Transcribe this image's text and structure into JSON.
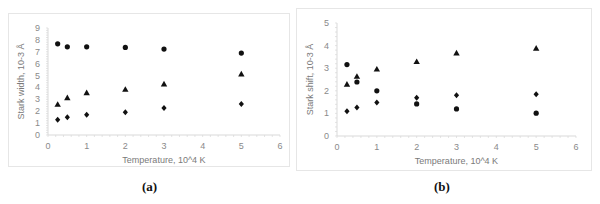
{
  "chart_data": [
    {
      "type": "scatter",
      "caption": "(a)",
      "title": "",
      "xlabel": "Temperature, 10^4 K",
      "ylabel": "Stark width, 10-3 Å",
      "xlim": [
        0,
        6
      ],
      "ylim": [
        0,
        9
      ],
      "xticks": [
        0,
        1,
        2,
        3,
        4,
        5,
        6
      ],
      "yticks": [
        0,
        1,
        2,
        3,
        4,
        5,
        6,
        7,
        8,
        9
      ],
      "grid": false,
      "legend": "none",
      "series": [
        {
          "name": "series-circle",
          "marker": "circle",
          "x": [
            0.25,
            0.5,
            1,
            2,
            3,
            5
          ],
          "y": [
            7.67,
            7.42,
            7.42,
            7.37,
            7.23,
            6.89
          ]
        },
        {
          "name": "series-triangle",
          "marker": "triangle",
          "x": [
            0.25,
            0.5,
            1,
            2,
            3,
            5
          ],
          "y": [
            2.58,
            3.13,
            3.55,
            3.84,
            4.29,
            5.13
          ]
        },
        {
          "name": "series-diamond",
          "marker": "diamond",
          "x": [
            0.25,
            0.5,
            1,
            2,
            3,
            5
          ],
          "y": [
            1.29,
            1.49,
            1.71,
            1.91,
            2.27,
            2.6
          ]
        }
      ]
    },
    {
      "type": "scatter",
      "caption": "(b)",
      "title": "",
      "xlabel": "Temperature, 10^4 K",
      "ylabel": "Stark shift, 10-3 Å",
      "xlim": [
        0,
        6
      ],
      "ylim": [
        0,
        5
      ],
      "xticks": [
        0,
        1,
        2,
        3,
        4,
        5,
        6
      ],
      "yticks": [
        0,
        1,
        2,
        3,
        4,
        5
      ],
      "grid": false,
      "legend": "none",
      "series": [
        {
          "name": "series-circle",
          "marker": "circle",
          "x": [
            0.25,
            0.5,
            1,
            2,
            3,
            5
          ],
          "y": [
            3.16,
            2.39,
            2.0,
            1.42,
            1.2,
            1.01
          ]
        },
        {
          "name": "series-triangle",
          "marker": "triangle",
          "x": [
            0.25,
            0.5,
            1,
            2,
            3,
            5
          ],
          "y": [
            2.29,
            2.64,
            2.96,
            3.29,
            3.67,
            3.88
          ]
        },
        {
          "name": "series-diamond",
          "marker": "diamond",
          "x": [
            0.25,
            0.5,
            1,
            2,
            3,
            5
          ],
          "y": [
            1.1,
            1.26,
            1.48,
            1.69,
            1.8,
            1.85
          ]
        }
      ]
    }
  ],
  "colors": {
    "marker": "#111111",
    "axis": "#d9d9d9",
    "tick_text": "#8a8a8a"
  }
}
